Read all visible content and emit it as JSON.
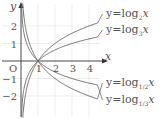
{
  "chart_data": {
    "type": "line",
    "title": "",
    "xlabel": "x",
    "ylabel": "y",
    "origin_label": "O",
    "xlim": [
      -1.2,
      8.2
    ],
    "ylim": [
      -3.4,
      3.6
    ],
    "x_ticks": [
      1,
      2,
      3,
      4
    ],
    "x_tick_labels": [
      "1",
      "2",
      "3",
      "4"
    ],
    "y_ticks": [
      2,
      1,
      -1,
      -2
    ],
    "y_tick_labels": [
      "2",
      "1",
      "−1",
      "−2"
    ],
    "grid": true,
    "legend_placement": "inline-right",
    "series": [
      {
        "name": "y=log_2 x",
        "base": 2,
        "label_prefix": "y=log",
        "label_sub": "2",
        "label_suffix": "x",
        "x_range": [
          0.1,
          4.5
        ]
      },
      {
        "name": "y=log_3 x",
        "base": 3,
        "label_prefix": "y=log",
        "label_sub": "3",
        "label_suffix": "x",
        "x_range": [
          0.03,
          4.5
        ]
      },
      {
        "name": "y=log_{1/2} x",
        "base": 0.5,
        "label_prefix": "y=log",
        "label_sub": "1/2",
        "label_suffix": "x",
        "x_range": [
          0.1,
          4.5
        ]
      },
      {
        "name": "y=log_{1/3} x",
        "base": 0.3333333,
        "label_prefix": "y=log",
        "label_sub": "1/3",
        "label_suffix": "x",
        "x_range": [
          0.03,
          4.5
        ]
      }
    ],
    "colors": {
      "curve": "#6b6b6b",
      "axis": "#333333",
      "grid": "#e2e2e2",
      "text": "#555555"
    }
  }
}
